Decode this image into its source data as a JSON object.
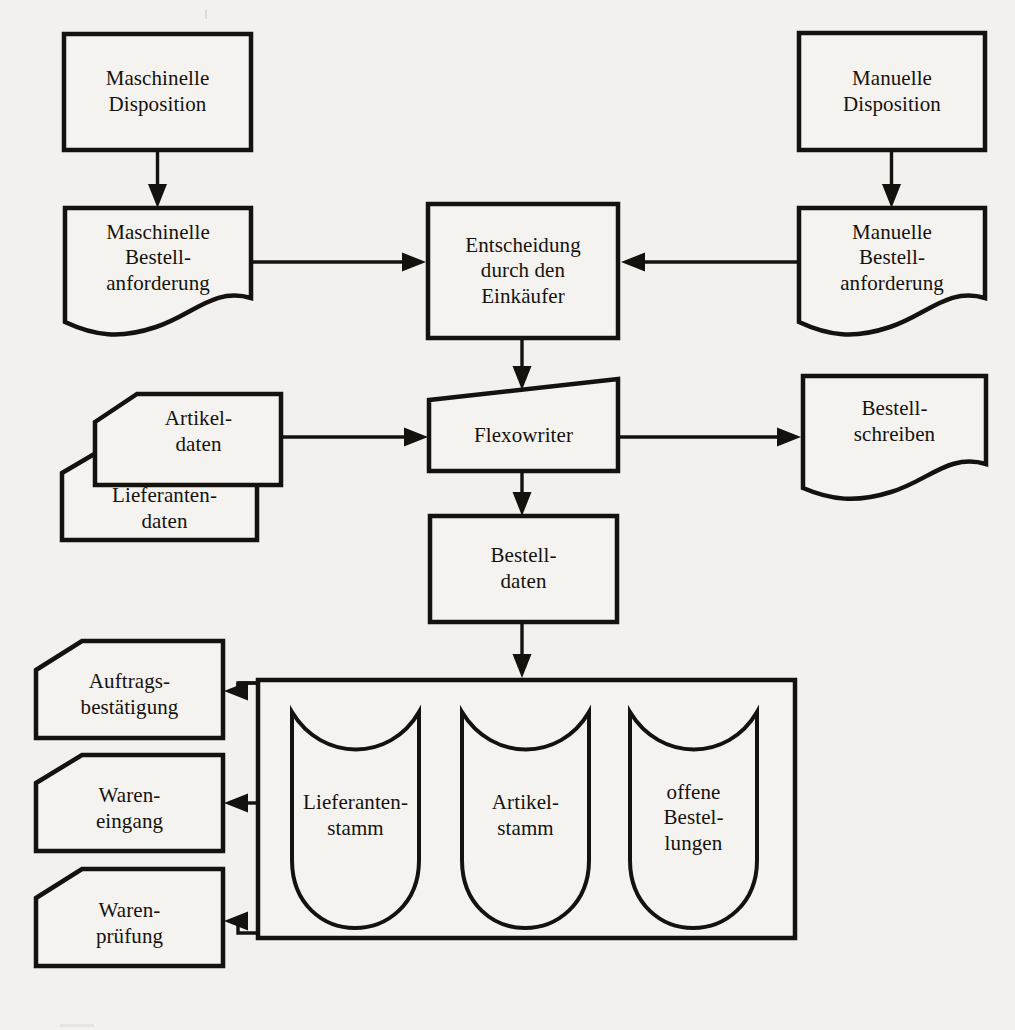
{
  "diagram": {
    "language": "de",
    "ink_color": "#15120e",
    "paper_color": "#f2f1ee",
    "nodes": [
      {
        "id": "maschinelle-disposition",
        "label": "Maschinelle\nDisposition",
        "shape": "process-rectangle"
      },
      {
        "id": "manuelle-disposition",
        "label": "Manuelle\nDisposition",
        "shape": "process-rectangle"
      },
      {
        "id": "maschinelle-bestellanforderung",
        "label": "Maschinelle\nBestell-\nanforderung",
        "shape": "document"
      },
      {
        "id": "manuelle-bestellanforderung",
        "label": "Manuelle\nBestell-\nanforderung",
        "shape": "document"
      },
      {
        "id": "entscheidung-einkaeufer",
        "label": "Entscheidung\ndurch den\nEinkäufer",
        "shape": "process-rectangle"
      },
      {
        "id": "artikeldaten",
        "label": "Artikel-\ndaten",
        "shape": "punched-card"
      },
      {
        "id": "lieferantendaten",
        "label": "Lieferanten-\ndaten",
        "shape": "punched-card"
      },
      {
        "id": "flexowriter",
        "label": "Flexowriter",
        "shape": "trapezoid-manual-operation"
      },
      {
        "id": "bestellschreiben",
        "label": "Bestell-\nschreiben",
        "shape": "document"
      },
      {
        "id": "bestelldaten",
        "label": "Bestell-\ndaten",
        "shape": "process-rectangle"
      },
      {
        "id": "datenbestand-container",
        "label": "",
        "shape": "container-rectangle"
      },
      {
        "id": "lieferantenstamm",
        "label": "Lieferanten-\nstamm",
        "shape": "direct-access-storage"
      },
      {
        "id": "artikelstamm",
        "label": "Artikel-\nstamm",
        "shape": "direct-access-storage"
      },
      {
        "id": "offene-bestellungen",
        "label": "offene\nBestel-\nlungen",
        "shape": "direct-access-storage"
      },
      {
        "id": "auftragsbestaetigung",
        "label": "Auftrags-\nbestätigung",
        "shape": "punched-card"
      },
      {
        "id": "wareneingang",
        "label": "Waren-\neingang",
        "shape": "punched-card"
      },
      {
        "id": "warenpruefung",
        "label": "Waren-\nprüfung",
        "shape": "punched-card"
      }
    ],
    "edges": [
      {
        "id": "edge-masch-disp-to-masch-ba",
        "from": "maschinelle-disposition",
        "to": "maschinelle-bestellanforderung",
        "direction": "down"
      },
      {
        "id": "edge-man-disp-to-man-ba",
        "from": "manuelle-disposition",
        "to": "manuelle-bestellanforderung",
        "direction": "down"
      },
      {
        "id": "edge-masch-ba-to-entsch",
        "from": "maschinelle-bestellanforderung",
        "to": "entscheidung-einkaeufer",
        "direction": "right"
      },
      {
        "id": "edge-man-ba-to-entsch",
        "from": "manuelle-bestellanforderung",
        "to": "entscheidung-einkaeufer",
        "direction": "left"
      },
      {
        "id": "edge-entsch-to-flexo",
        "from": "entscheidung-einkaeufer",
        "to": "flexowriter",
        "direction": "down"
      },
      {
        "id": "edge-stammdaten-to-flexo",
        "from": "artikeldaten",
        "to": "flexowriter",
        "direction": "right"
      },
      {
        "id": "edge-flexo-to-bestellschr",
        "from": "flexowriter",
        "to": "bestellschreiben",
        "direction": "right"
      },
      {
        "id": "edge-flexo-to-bestelldaten",
        "from": "flexowriter",
        "to": "bestelldaten",
        "direction": "down"
      },
      {
        "id": "edge-bestelldaten-to-bestand",
        "from": "bestelldaten",
        "to": "datenbestand-container",
        "direction": "down"
      },
      {
        "id": "edge-bestand-to-auftragsb",
        "from": "datenbestand-container",
        "to": "auftragsbestaetigung",
        "direction": "left"
      },
      {
        "id": "edge-bestand-to-wareneingang",
        "from": "datenbestand-container",
        "to": "wareneingang",
        "direction": "left"
      },
      {
        "id": "edge-bestand-to-warenpruef",
        "from": "datenbestand-container",
        "to": "warenpruefung",
        "direction": "left"
      }
    ]
  }
}
